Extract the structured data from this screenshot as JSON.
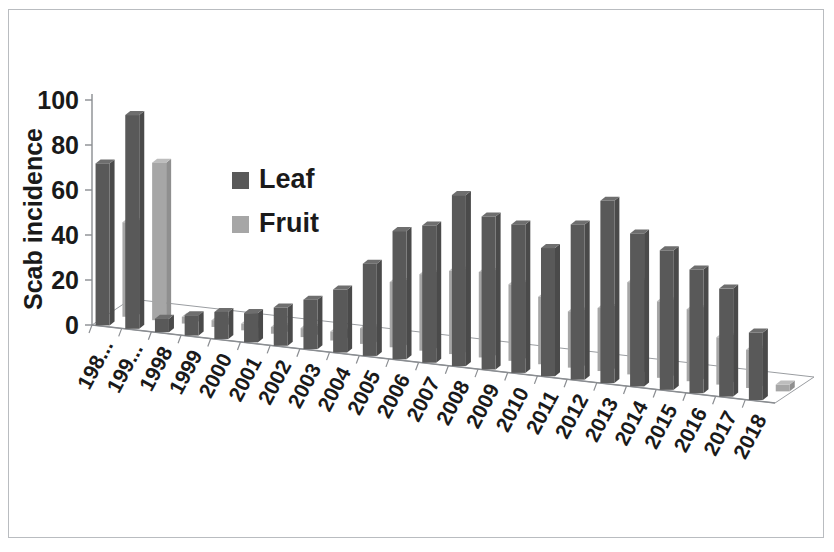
{
  "chart_data": {
    "type": "bar",
    "title": "",
    "subtitle": "",
    "xlabel": "",
    "ylabel": "Scab incidence",
    "ylim": [
      0,
      100
    ],
    "yticks": [
      0,
      20,
      40,
      60,
      80,
      100
    ],
    "grid": false,
    "three_d": true,
    "legend_position": "upper-left-inside",
    "categories": [
      "198...",
      "199...",
      "1998",
      "1999",
      "2000",
      "2001",
      "2002",
      "2003",
      "2004",
      "2005",
      "2006",
      "2007",
      "2008",
      "2009",
      "2010",
      "2011",
      "2012",
      "2013",
      "2014",
      "2015",
      "2016",
      "2017",
      "2018"
    ],
    "series": [
      {
        "name": "Leaf",
        "color": "#595959",
        "values": [
          72,
          95,
          6,
          9,
          12,
          13,
          17,
          22,
          28,
          41,
          57,
          61,
          76,
          68,
          66,
          57,
          69,
          81,
          68,
          62,
          55,
          48,
          30
        ]
      },
      {
        "name": "Fruit",
        "color": "#a6a6a6",
        "values": [
          42,
          70,
          3,
          3,
          3,
          3,
          4,
          4,
          7,
          29,
          34,
          37,
          38,
          34,
          30,
          25,
          28,
          41,
          34,
          32,
          21,
          17,
          3
        ]
      }
    ]
  },
  "axes": {
    "y_axis_title": "Scab incidence",
    "y_tick_labels": [
      "100",
      "80",
      "60",
      "40",
      "20",
      "0"
    ],
    "x_tick_labels": [
      "198...",
      "199...",
      "1998",
      "1999",
      "2000",
      "2001",
      "2002",
      "2003",
      "2004",
      "2005",
      "2006",
      "2007",
      "2008",
      "2009",
      "2010",
      "2011",
      "2012",
      "2013",
      "2014",
      "2015",
      "2016",
      "2017",
      "2018"
    ]
  },
  "legend": {
    "items": [
      {
        "label": "Leaf",
        "color": "#595959"
      },
      {
        "label": "Fruit",
        "color": "#a6a6a6"
      }
    ]
  },
  "colors": {
    "leaf": "#595959",
    "fruit": "#a6a6a6",
    "leaf_top": "#6e6e6e",
    "leaf_side": "#4a4a4a",
    "fruit_top": "#bdbdbd",
    "fruit_side": "#8f8f8f",
    "axis": "#8a8d91",
    "frame": "#b9bcc0",
    "text": "#1a1a1a",
    "background": "#ffffff"
  }
}
